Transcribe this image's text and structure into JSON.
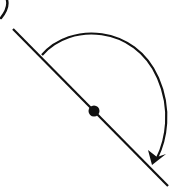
{
  "diagram": {
    "type": "rotation-about-point",
    "label_fragment": ")",
    "stroke_color": "#111111",
    "line": {
      "x1": 13,
      "y1": 29,
      "x2": 168,
      "y2": 186
    },
    "pivot": {
      "cx": 94,
      "cy": 111,
      "r": 5
    },
    "arc": {
      "start": [
        42,
        55
      ],
      "end": [
        155,
        165
      ],
      "direction": "clockwise",
      "angle_deg": 180
    }
  }
}
